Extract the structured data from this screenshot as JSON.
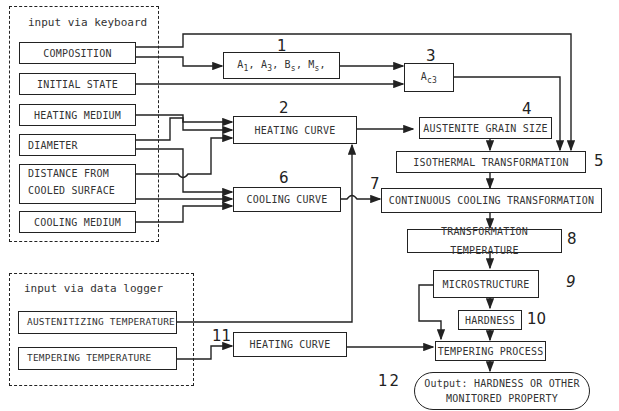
{
  "groups": {
    "keyboard": {
      "title": "input via keyboard"
    },
    "logger": {
      "title": "input via data logger"
    }
  },
  "inputs": {
    "composition": "COMPOSITION",
    "initial_state": "INITIAL STATE",
    "heating_medium": "HEATING MEDIUM",
    "diameter": "DIAMETER",
    "distance_line1": "DISTANCE FROM",
    "distance_line2": "COOLED SURFACE",
    "cooling_medium": "COOLING MEDIUM",
    "austenitizing_temperature": "AUSTENITIZING TEMPERATURE",
    "tempering_temperature": "TEMPERING TEMPERATURE"
  },
  "blocks": {
    "b1": {
      "num": "1",
      "A": "A",
      "s1": "1",
      "s3": "3",
      "B": "B",
      "sBs": "s",
      "M": "M",
      "sMs": "s",
      "sep": ", ",
      "tail": ","
    },
    "b2": {
      "num": "2",
      "label": "HEATING CURVE"
    },
    "b3": {
      "num": "3",
      "A": "A",
      "sub": "c3"
    },
    "b4": {
      "num": "4",
      "label": "AUSTENITE GRAIN SIZE"
    },
    "b5": {
      "num": "5",
      "label": "ISOTHERMAL TRANSFORMATION"
    },
    "b6": {
      "num": "6",
      "label": "COOLING  CURVE"
    },
    "b7": {
      "num": "7",
      "label": "CONTINUOUS COOLING  TRANSFORMATION"
    },
    "b8": {
      "num": "8",
      "label": "TRANSFORMATION TEMPERATURE"
    },
    "b9": {
      "num": "9",
      "label": "MICROSTRUCTURE"
    },
    "b10": {
      "num": "10",
      "label": "HARDNESS"
    },
    "b11": {
      "num": "11",
      "label": "HEATING CURVE"
    },
    "b_temper": {
      "label": "TEMPERING PROCESS"
    },
    "b12": {
      "num": "12",
      "line1": "Output: HARDNESS OR OTHER",
      "line2": "MONITORED PROPERTY"
    }
  }
}
